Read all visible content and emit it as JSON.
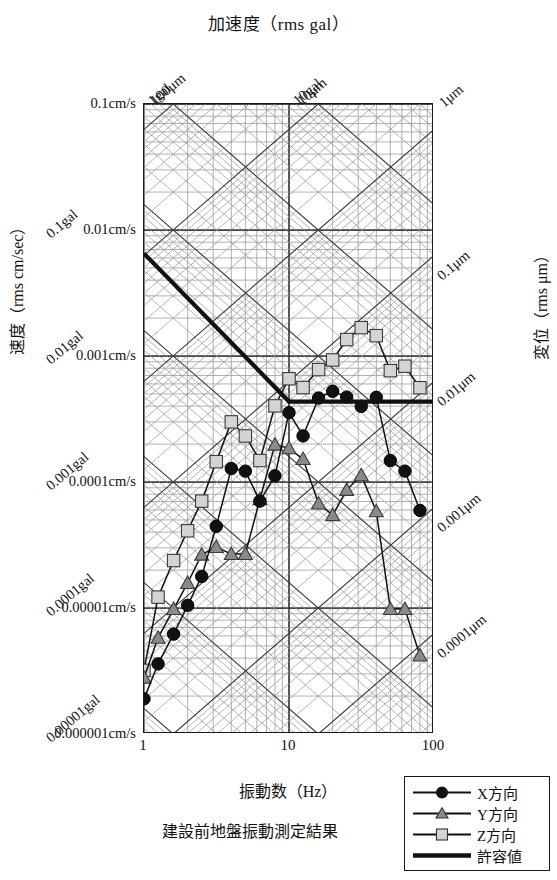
{
  "chart_data": {
    "type": "line",
    "title": "加速度（rms gal）",
    "xlabel": "振動数（Hz）",
    "ylabel": "速度（rms cm/sec）",
    "ylabel_right": "変位（rms μm）",
    "caption": "建設前地盤振動測定結果",
    "xscale": "log",
    "yscale": "log",
    "xlim": [
      1,
      100
    ],
    "ylim": [
      1e-06,
      0.1
    ],
    "grid": true,
    "legend_position": "bottom-right",
    "x_ticks": [
      "1",
      "10",
      "100"
    ],
    "x_tick_values": [
      1,
      10,
      100
    ],
    "y_ticks_velocity": [
      "0.1cm/s",
      "0.01cm/s",
      "0.001cm/s",
      "0.0001cm/s",
      "0.00001cm/s",
      "0.000001cm/s"
    ],
    "y_tick_values": [
      0.1,
      0.01,
      0.001,
      0.0001,
      1e-05,
      1e-06
    ],
    "acceleration_diagonal_labels": [
      "0.1gal",
      "0.01gal",
      "0.001gal",
      "0.0001gal",
      "0.00001gal"
    ],
    "acceleration_top_labels": [
      "1gal",
      "10gal"
    ],
    "displacement_top_labels": [
      "100μm",
      "10μm",
      "1μm"
    ],
    "displacement_right_labels": [
      "0.1μm",
      "0.01μm",
      "0.001μm",
      "0.0001μm"
    ],
    "series": [
      {
        "name": "X方向",
        "marker": "circle-filled",
        "color": "#111111",
        "x": [
          1.0,
          1.25,
          1.6,
          2.0,
          2.5,
          3.15,
          4.0,
          5.0,
          6.3,
          8.0,
          10.0,
          12.5,
          16.0,
          20.0,
          25.0,
          31.5,
          40.0,
          50.0,
          63.0,
          80.0
        ],
        "y": [
          1.9e-06,
          3.6e-06,
          6.2e-06,
          1.05e-05,
          1.78e-05,
          4.45e-05,
          0.000128,
          0.000122,
          7.05e-05,
          0.000112,
          0.000355,
          0.000232,
          0.000464,
          0.000525,
          0.000472,
          0.000398,
          0.00047,
          0.000148,
          0.000122,
          5.95e-05
        ]
      },
      {
        "name": "Y方向",
        "marker": "triangle",
        "color": "#8a8a8a",
        "x": [
          1.0,
          1.25,
          1.6,
          2.0,
          2.5,
          3.15,
          4.0,
          5.0,
          6.3,
          8.0,
          10.0,
          12.5,
          16.0,
          20.0,
          25.0,
          31.5,
          40.0,
          50.0,
          63.0,
          80.0
        ],
        "y": [
          2.8e-06,
          5.8e-06,
          9.8e-06,
          1.58e-05,
          2.65e-05,
          3.05e-05,
          2.68e-05,
          2.68e-05,
          7.3e-05,
          0.000198,
          0.000185,
          0.000152,
          6.75e-05,
          5.45e-05,
          8.65e-05,
          0.000113,
          5.85e-05,
          9.8e-06,
          9.8e-06,
          4.2e-06
        ]
      },
      {
        "name": "Z方向",
        "marker": "square",
        "color": "#d4d4d4",
        "x": [
          1.0,
          1.25,
          1.6,
          2.0,
          2.5,
          3.15,
          4.0,
          5.0,
          6.3,
          8.0,
          10.0,
          12.5,
          16.0,
          20.0,
          25.0,
          31.5,
          40.0,
          50.0,
          63.0,
          80.0
        ],
        "y": [
          3.2e-06,
          1.22e-05,
          2.38e-05,
          4.1e-05,
          7.05e-05,
          0.000145,
          0.0003,
          0.000232,
          0.000148,
          0.000402,
          0.00066,
          0.000562,
          0.00078,
          0.00093,
          0.00135,
          0.00168,
          0.00145,
          0.000765,
          0.00083,
          0.00056
        ]
      }
    ],
    "allowable": {
      "name": "許容値",
      "color": "#111111",
      "x": [
        1.0,
        10.0,
        100.0
      ],
      "y": [
        0.0065,
        0.000435,
        0.000435
      ]
    }
  },
  "legend": {
    "items": [
      {
        "label": "X方向",
        "marker": "circle-filled"
      },
      {
        "label": "Y方向",
        "marker": "triangle"
      },
      {
        "label": "Z方向",
        "marker": "square"
      },
      {
        "label": "許容値",
        "marker": "thick-line"
      }
    ]
  }
}
